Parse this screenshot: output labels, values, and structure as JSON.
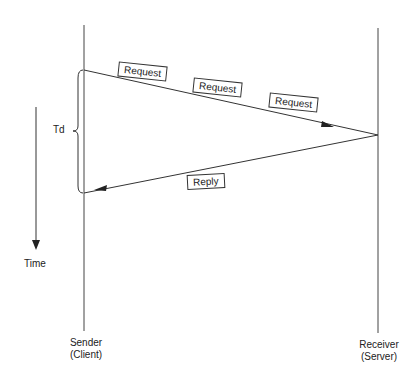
{
  "diagram": {
    "type": "sequence-timing",
    "participants": [
      {
        "id": "sender",
        "label_line1": "Sender",
        "label_line2": "(Client)"
      },
      {
        "id": "receiver",
        "label_line1": "Receiver",
        "label_line2": "(Server)"
      }
    ],
    "messages": [
      {
        "from": "sender",
        "to": "receiver",
        "labels": [
          "Request",
          "Request",
          "Request"
        ]
      },
      {
        "from": "receiver",
        "to": "sender",
        "labels": [
          "Reply"
        ]
      }
    ],
    "delay_label": "Td",
    "time_axis_label": "Time"
  }
}
